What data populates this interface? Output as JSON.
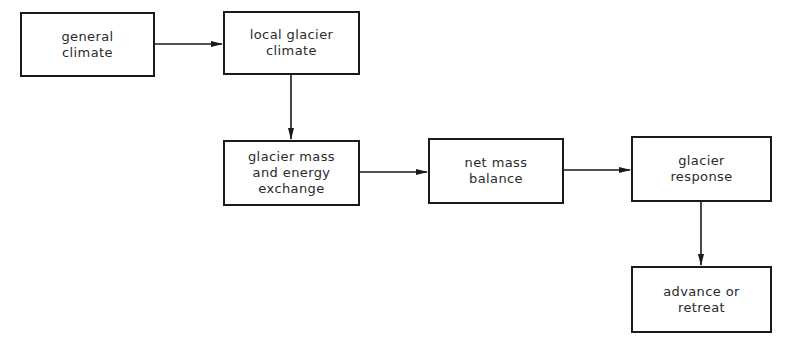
{
  "diagram": {
    "type": "flowchart",
    "nodes": [
      {
        "id": "general_climate",
        "label": "general\nclimate"
      },
      {
        "id": "local_glacier_climate",
        "label": "local glacier\nclimate"
      },
      {
        "id": "mass_energy_exchange",
        "label": "glacier mass\nand energy\nexchange"
      },
      {
        "id": "net_mass_balance",
        "label": "net mass\nbalance"
      },
      {
        "id": "glacier_response",
        "label": "glacier\nresponse"
      },
      {
        "id": "advance_or_retreat",
        "label": "advance or\nretreat"
      }
    ],
    "edges": [
      {
        "from": "general_climate",
        "to": "local_glacier_climate"
      },
      {
        "from": "local_glacier_climate",
        "to": "mass_energy_exchange"
      },
      {
        "from": "mass_energy_exchange",
        "to": "net_mass_balance"
      },
      {
        "from": "net_mass_balance",
        "to": "glacier_response"
      },
      {
        "from": "glacier_response",
        "to": "advance_or_retreat"
      }
    ]
  }
}
